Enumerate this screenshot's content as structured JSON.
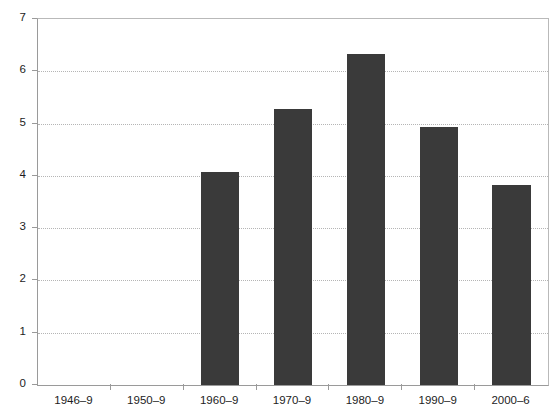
{
  "chart_data": {
    "type": "bar",
    "title": "",
    "subtitle": "",
    "xlabel": "",
    "ylabel": "",
    "categories": [
      "1946–9",
      "1950–9",
      "1960–9",
      "1970–9",
      "1980–9",
      "1990–9",
      "2000–6"
    ],
    "values": [
      null,
      null,
      4.07,
      5.28,
      6.34,
      4.94,
      3.83
    ],
    "ylim": [
      0,
      7
    ],
    "ytick_labels": [
      "0",
      "1",
      "2",
      "3",
      "4",
      "5",
      "6",
      "7"
    ],
    "ytick_values": [
      0,
      1,
      2,
      3,
      4,
      5,
      6,
      7
    ],
    "grid": true,
    "grid_axis": "y",
    "grid_style": "dotted",
    "legend": null,
    "legend_position": "none",
    "annotations": [],
    "bar_color": "#3a3a3a",
    "grid_color": "#b5b5b5",
    "axis_color": "#9a9a9a",
    "background_color": "#ffffff",
    "text_color": "#1d1d1d"
  }
}
